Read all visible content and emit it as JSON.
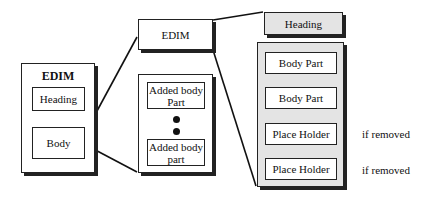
{
  "diagram": {
    "left_edim": {
      "title": "EDIM",
      "parts": [
        "Heading",
        "Body"
      ]
    },
    "middle": {
      "edim_label": "EDIM",
      "body_container": {
        "parts": [
          "Added body Part",
          "Added body part"
        ],
        "ellipsis": "vertical dots"
      }
    },
    "right": {
      "heading_label": "Heading",
      "body_container": {
        "parts": [
          {
            "label": "Body Part",
            "note": ""
          },
          {
            "label": "Body Part",
            "note": ""
          },
          {
            "label": "Place Holder",
            "note": "if removed"
          },
          {
            "label": "Place Holder",
            "note": "if removed"
          }
        ]
      }
    }
  }
}
